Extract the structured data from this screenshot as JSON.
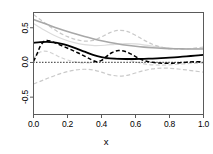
{
  "chart_data": {
    "type": "line",
    "title": "",
    "xlabel": "x",
    "ylabel": "",
    "xlim": [
      0.0,
      1.0
    ],
    "ylim": [
      -0.75,
      0.72
    ],
    "grid": false,
    "legend": "none",
    "xticks": [
      "0.0",
      "0.2",
      "0.4",
      "0.6",
      "0.8",
      "1.0"
    ],
    "xtick_values": [
      0.0,
      0.2,
      0.4,
      0.6,
      0.8,
      1.0
    ],
    "yticks": [
      "0.5",
      "0.0",
      "-0.5"
    ],
    "ytick_values": [
      0.5,
      0.0,
      -0.5
    ],
    "series": [
      {
        "name": "gray-solid-trend",
        "style": "solid",
        "color": "#a8a8a8",
        "width": 1.6,
        "x": [
          0.0,
          0.05,
          0.1,
          0.15,
          0.2,
          0.25,
          0.3,
          0.35,
          0.4,
          0.45,
          0.5,
          0.55,
          0.6,
          0.65,
          0.7,
          0.75,
          0.8,
          0.85,
          0.9,
          0.95,
          1.0
        ],
        "y": [
          0.62,
          0.575,
          0.53,
          0.487,
          0.447,
          0.409,
          0.374,
          0.342,
          0.313,
          0.288,
          0.266,
          0.248,
          0.233,
          0.221,
          0.212,
          0.205,
          0.2,
          0.197,
          0.195,
          0.194,
          0.193
        ]
      },
      {
        "name": "black-solid-estimate",
        "style": "solid",
        "color": "#000000",
        "width": 1.8,
        "x": [
          0.0,
          0.04,
          0.08,
          0.12,
          0.16,
          0.2,
          0.25,
          0.3,
          0.35,
          0.4,
          0.45,
          0.5,
          0.55,
          0.6,
          0.65,
          0.7,
          0.75,
          0.8,
          0.85,
          0.9,
          0.95,
          1.0
        ],
        "y": [
          0.282,
          0.292,
          0.296,
          0.289,
          0.272,
          0.246,
          0.203,
          0.155,
          0.11,
          0.078,
          0.06,
          0.052,
          0.05,
          0.05,
          0.052,
          0.056,
          0.062,
          0.069,
          0.078,
          0.088,
          0.098,
          0.108
        ]
      },
      {
        "name": "black-dashed-estimate",
        "style": "dashed",
        "color": "#000000",
        "width": 1.5,
        "x": [
          0.0,
          0.02,
          0.04,
          0.06,
          0.08,
          0.11,
          0.14,
          0.18,
          0.22,
          0.26,
          0.3,
          0.34,
          0.37,
          0.4,
          0.43,
          0.46,
          0.5,
          0.54,
          0.58,
          0.62,
          0.66,
          0.7,
          0.74,
          0.78,
          0.82,
          0.86,
          0.9,
          0.94,
          1.0
        ],
        "y": [
          0.015,
          0.12,
          0.235,
          0.3,
          0.318,
          0.3,
          0.268,
          0.228,
          0.185,
          0.14,
          0.092,
          0.04,
          0.012,
          0.03,
          0.088,
          0.14,
          0.172,
          0.158,
          0.112,
          0.058,
          0.02,
          0.002,
          -0.008,
          -0.012,
          -0.01,
          -0.004,
          0.004,
          0.01,
          0.012
        ]
      },
      {
        "name": "zero-dotted-reference",
        "style": "dotted",
        "color": "#000000",
        "width": 1.2,
        "x": [
          0.0,
          1.0
        ],
        "y": [
          0.0,
          0.0
        ]
      },
      {
        "name": "upper-confidence-band",
        "style": "dashed",
        "color": "#c9c9c9",
        "width": 1.2,
        "x": [
          0.0,
          0.05,
          0.1,
          0.15,
          0.2,
          0.25,
          0.3,
          0.35,
          0.4,
          0.45,
          0.5,
          0.55,
          0.6,
          0.65,
          0.7,
          0.75,
          0.8,
          0.85,
          0.9,
          0.95,
          1.0
        ],
        "y": [
          0.69,
          0.6,
          0.51,
          0.432,
          0.372,
          0.33,
          0.308,
          0.318,
          0.368,
          0.43,
          0.462,
          0.448,
          0.392,
          0.322,
          0.262,
          0.222,
          0.2,
          0.192,
          0.196,
          0.208,
          0.222
        ]
      },
      {
        "name": "lower-confidence-band",
        "style": "dashed",
        "color": "#c9c9c9",
        "width": 1.2,
        "x": [
          0.0,
          0.05,
          0.1,
          0.15,
          0.2,
          0.25,
          0.3,
          0.35,
          0.4,
          0.45,
          0.5,
          0.55,
          0.6,
          0.65,
          0.7,
          0.75,
          0.8,
          0.85,
          0.9,
          0.95,
          1.0
        ],
        "y": [
          -0.31,
          -0.262,
          -0.212,
          -0.168,
          -0.132,
          -0.108,
          -0.098,
          -0.108,
          -0.14,
          -0.178,
          -0.196,
          -0.186,
          -0.152,
          -0.116,
          -0.092,
          -0.082,
          -0.084,
          -0.094,
          -0.108,
          -0.124,
          -0.14
        ]
      },
      {
        "name": "gray-wiggle-band",
        "style": "dashed",
        "color": "#d2d2d2",
        "width": 1.2,
        "x": [
          0.0,
          0.04,
          0.08,
          0.12,
          0.16,
          0.2,
          0.25,
          0.3,
          0.35,
          0.4,
          0.45,
          0.5,
          0.55,
          0.6,
          0.65,
          0.7,
          0.75,
          0.8,
          0.85,
          0.9,
          0.95,
          1.0
        ],
        "y": [
          0.06,
          0.15,
          0.16,
          0.12,
          0.072,
          0.036,
          0.006,
          -0.006,
          0.004,
          0.032,
          0.058,
          0.062,
          0.04,
          0.008,
          -0.02,
          -0.034,
          -0.038,
          -0.034,
          -0.026,
          -0.018,
          -0.012,
          -0.01
        ]
      },
      {
        "name": "gray-light-upper-inner",
        "style": "solid",
        "color": "#dcdcdc",
        "width": 1.2,
        "x": [
          0.0,
          0.06,
          0.12,
          0.18,
          0.24,
          0.3,
          0.36,
          0.42,
          0.48,
          0.54,
          0.6,
          0.66,
          0.72,
          0.78,
          0.84,
          0.9,
          0.96,
          1.0
        ],
        "y": [
          0.56,
          0.47,
          0.392,
          0.33,
          0.285,
          0.256,
          0.244,
          0.248,
          0.262,
          0.272,
          0.268,
          0.25,
          0.228,
          0.21,
          0.2,
          0.196,
          0.198,
          0.202
        ]
      }
    ]
  },
  "axes": {
    "x_title": "x",
    "x_tick_labels": [
      "0.0",
      "0.2",
      "0.4",
      "0.6",
      "0.8",
      "1.0"
    ],
    "y_tick_labels": [
      "0.5",
      "0.0",
      "-0.5"
    ]
  },
  "colors": {
    "frame": "#5a5a5a",
    "primary": "#000000",
    "band": "#c9c9c9",
    "trend": "#a8a8a8",
    "background": "#ffffff"
  }
}
